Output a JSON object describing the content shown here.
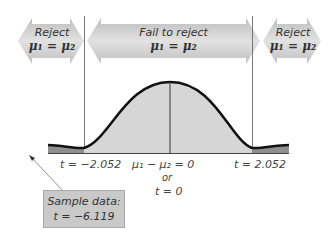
{
  "regions": {
    "left": {
      "line1": "Reject",
      "line2": "μ₁ = μ₂"
    },
    "middle": {
      "line1": "Fail to reject",
      "line2": "μ₁ = μ₂"
    },
    "right": {
      "line1": "Reject",
      "line2": "μ₁ = μ₂"
    }
  },
  "axis_labels": {
    "left_critical": "t = −2.052",
    "center_line1": "μ₁ − μ₂ = 0",
    "center_line2": "or",
    "center_line3": "t = 0",
    "right_critical": "t = 2.052"
  },
  "sample_box": {
    "line1": "Sample data:",
    "line2": "t = −6.119"
  },
  "colors": {
    "arrow_fill": "#c8c8c8",
    "curve_fill": "#d6d6d6",
    "tail_fill": "#8f8f8f",
    "curve_stroke": "#111111",
    "box_fill": "#c9c9c9"
  }
}
